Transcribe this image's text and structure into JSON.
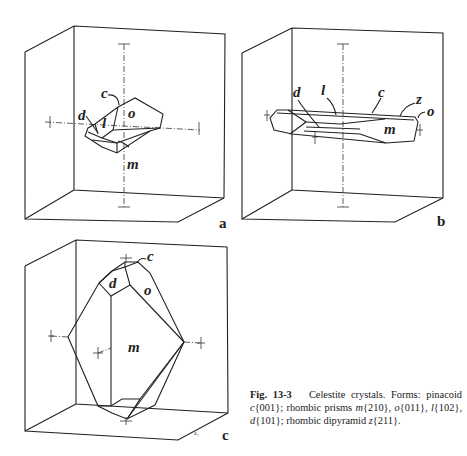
{
  "figure": {
    "number": "Fig. 13-3",
    "title": "Celestite crystals.",
    "caption_parts": [
      "Forms: pinacoid ",
      "c",
      "{001}; rhombic prisms ",
      "m",
      "{210}, ",
      "o",
      "{011}, ",
      "l",
      "{102}, ",
      "d",
      "{101}; rhombic dipyramid ",
      "z",
      "{211}."
    ]
  },
  "panels": [
    {
      "id": "a",
      "label": "a",
      "face_labels": [
        "c",
        "d",
        "l",
        "o",
        "m"
      ]
    },
    {
      "id": "b",
      "label": "b",
      "face_labels": [
        "d",
        "l",
        "c",
        "z",
        "o",
        "m"
      ]
    },
    {
      "id": "c",
      "label": "c",
      "face_labels": [
        "c",
        "d",
        "o",
        "m"
      ],
      "corner_mark": "a₁"
    }
  ]
}
